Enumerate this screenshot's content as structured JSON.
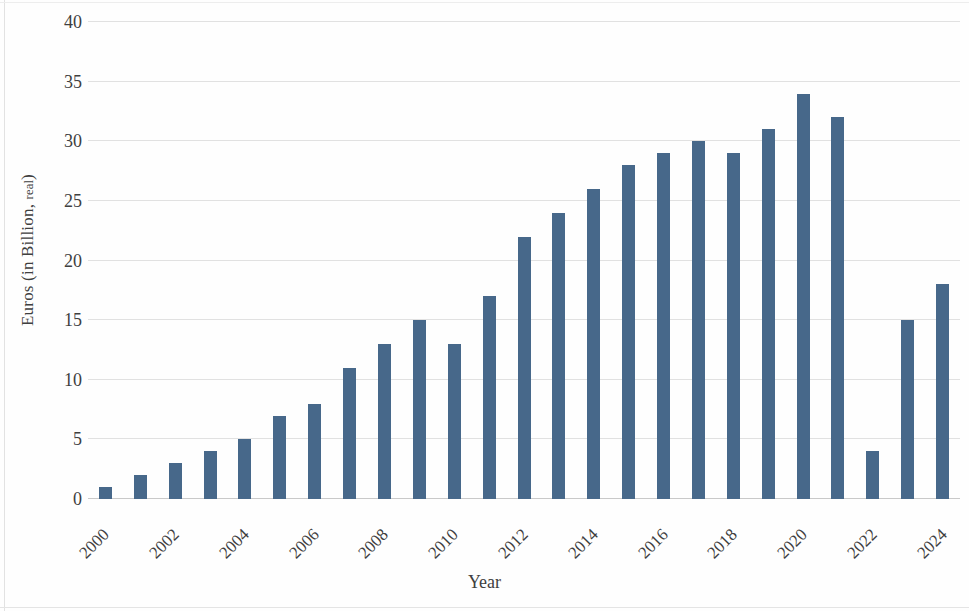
{
  "chart_data": {
    "type": "bar",
    "title": "",
    "xlabel": "Year",
    "ylabel": "Euros (in Billion, real)",
    "ylabel_main": "Euros (in Billion, ",
    "ylabel_small": "real",
    "ylabel_tail": ")",
    "categories": [
      "2000",
      "2001",
      "2002",
      "2003",
      "2004",
      "2005",
      "2006",
      "2007",
      "2008",
      "2009",
      "2010",
      "2011",
      "2012",
      "2013",
      "2014",
      "2015",
      "2016",
      "2017",
      "2018",
      "2019",
      "2020",
      "2021",
      "2022",
      "2023",
      "2024"
    ],
    "values": [
      1,
      2,
      3,
      4,
      5,
      7,
      8,
      11,
      13,
      15,
      13,
      17,
      22,
      24,
      26,
      28,
      29,
      30,
      29,
      31,
      34,
      32,
      4,
      15,
      18
    ],
    "visible_tick_labels": [
      "2000",
      "2002",
      "2004",
      "2006",
      "2008",
      "2010",
      "2012",
      "2014",
      "2016",
      "2018",
      "2020",
      "2022",
      "2024"
    ],
    "ylim": [
      0,
      40
    ],
    "y_ticks": [
      0,
      5,
      10,
      15,
      20,
      25,
      30,
      35,
      40
    ],
    "y_tick_labels": [
      "0",
      "5",
      "10",
      "15",
      "20",
      "25",
      "30",
      "35",
      "40"
    ],
    "grid": true,
    "grid_axis": "y",
    "legend": false,
    "bar_color": "#47688a",
    "grid_color": "#dcdcdc",
    "axis_color": "#c9c9c9",
    "text_color": "#3f3f3f",
    "x_tick_rotation": -45,
    "x_tick_interval": 2
  }
}
